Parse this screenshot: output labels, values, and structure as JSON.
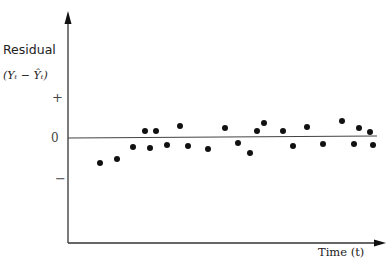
{
  "chart_data": {
    "type": "scatter",
    "title": "",
    "ylabel": "Residual",
    "ylabel_formula": "(Yₜ − Ŷₜ)",
    "xlabel": "Time (t)",
    "y_ticks": [
      "+",
      "0",
      "−"
    ],
    "reference_line": {
      "y": 0,
      "label": "0"
    },
    "grid": false,
    "legend": null,
    "points_px": [
      [
        100,
        163
      ],
      [
        117,
        159
      ],
      [
        133,
        147
      ],
      [
        145,
        131
      ],
      [
        150,
        148
      ],
      [
        156,
        131
      ],
      [
        167,
        145
      ],
      [
        180,
        126
      ],
      [
        188,
        146
      ],
      [
        208,
        149
      ],
      [
        225,
        128
      ],
      [
        238,
        143
      ],
      [
        250,
        153
      ],
      [
        257,
        131
      ],
      [
        264,
        123
      ],
      [
        283,
        131
      ],
      [
        293,
        146
      ],
      [
        307,
        127
      ],
      [
        323,
        144
      ],
      [
        342,
        121
      ],
      [
        354,
        144
      ],
      [
        359,
        128
      ],
      [
        370,
        132
      ],
      [
        373,
        145
      ]
    ],
    "x": [
      1,
      2,
      3,
      4,
      5,
      6,
      7,
      8,
      9,
      10,
      11,
      12,
      13,
      14,
      15,
      16,
      17,
      18,
      19,
      20,
      21,
      22,
      23,
      24
    ],
    "residuals_relative": [
      -0.6,
      -0.5,
      -0.2,
      0.2,
      -0.25,
      0.2,
      -0.2,
      0.3,
      -0.2,
      -0.3,
      0.25,
      -0.15,
      -0.4,
      0.2,
      0.4,
      0.2,
      -0.2,
      0.3,
      -0.15,
      0.45,
      -0.15,
      0.25,
      0.15,
      -0.2
    ],
    "note": "Residuals scattered randomly about zero with no systematic pattern over time"
  },
  "labels": {
    "ylabel": "Residual",
    "yformula": "(Yₜ  −  Ŷₜ)",
    "plus": "+",
    "zero": "0",
    "minus": "−",
    "xlabel": "Time (t)"
  }
}
